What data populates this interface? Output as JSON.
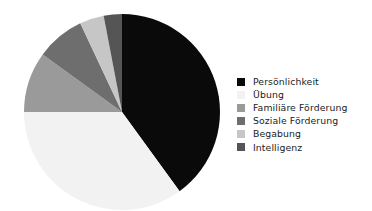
{
  "chart_data": {
    "type": "pie",
    "title": "",
    "subtitle": "",
    "xlabel": "",
    "ylabel": "",
    "grid": false,
    "legend_position": "right",
    "start_angle_deg": 0,
    "direction": "clockwise",
    "center": {
      "x": 122,
      "y": 112
    },
    "radius": 98,
    "categories": [
      "Persönlichkeit",
      "Übung",
      "Familiäre Förderung",
      "Soziale Förderung",
      "Begabung",
      "Intelligenz"
    ],
    "values": [
      40,
      35,
      10,
      8,
      4,
      3
    ],
    "unit": "%",
    "colors": [
      "#0a0a0a",
      "#f2f2f2",
      "#9a9a9a",
      "#6e6e6e",
      "#c6c6c6",
      "#555555"
    ],
    "slices": [
      {
        "label": "Persönlichkeit",
        "value": 40,
        "color": "#0a0a0a",
        "start_deg": 0,
        "end_deg": 144
      },
      {
        "label": "Übung",
        "value": 35,
        "color": "#f2f2f2",
        "start_deg": 144,
        "end_deg": 270
      },
      {
        "label": "Familiäre Förderung",
        "value": 10,
        "color": "#9a9a9a",
        "start_deg": 270,
        "end_deg": 306
      },
      {
        "label": "Soziale Förderung",
        "value": 8,
        "color": "#6e6e6e",
        "start_deg": 306,
        "end_deg": 334.8
      },
      {
        "label": "Begabung",
        "value": 4,
        "color": "#c6c6c6",
        "start_deg": 334.8,
        "end_deg": 349.2
      },
      {
        "label": "Intelligenz",
        "value": 3,
        "color": "#555555",
        "start_deg": 349.2,
        "end_deg": 360
      }
    ]
  },
  "legend": {
    "items": [
      {
        "label": "Persönlichkeit",
        "color": "#0a0a0a"
      },
      {
        "label": "Übung",
        "color": "#f2f2f2"
      },
      {
        "label": "Familiäre Förderung",
        "color": "#9a9a9a"
      },
      {
        "label": "Soziale Förderung",
        "color": "#6e6e6e"
      },
      {
        "label": "Begabung",
        "color": "#c6c6c6"
      },
      {
        "label": "Intelligenz",
        "color": "#555555"
      }
    ]
  }
}
